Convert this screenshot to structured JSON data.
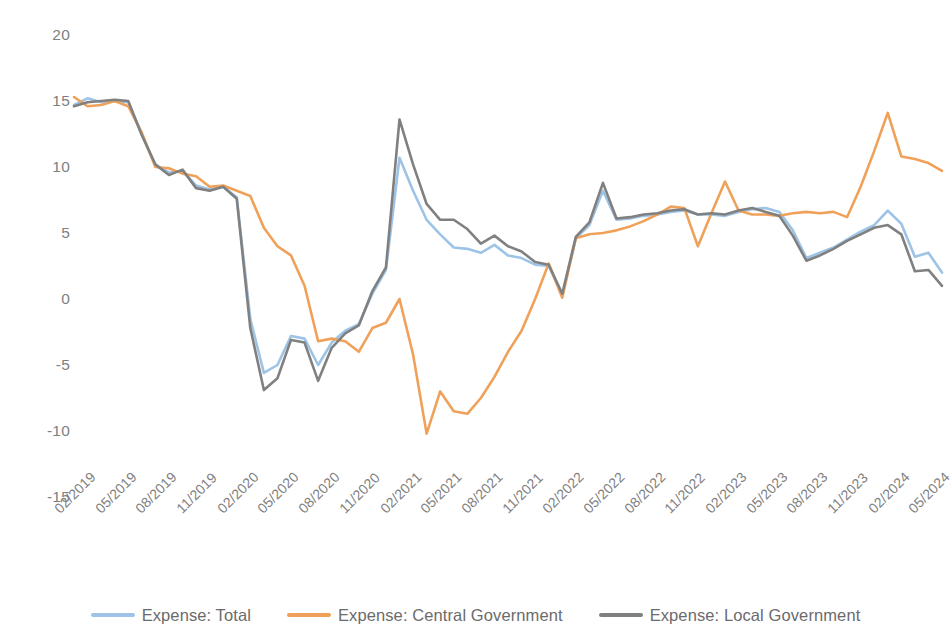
{
  "chart_data": {
    "type": "line",
    "title": "",
    "subtitle": "",
    "xlabel": "",
    "ylabel": "",
    "ylim": [
      -15,
      20
    ],
    "yticks": [
      20,
      15,
      10,
      5,
      0,
      -5,
      -10,
      -15
    ],
    "grid": false,
    "legend_position": "bottom",
    "x_tick_labels": [
      "02/2019",
      "05/2019",
      "08/2019",
      "11/2019",
      "02/2020",
      "05/2020",
      "08/2020",
      "11/2020",
      "02/2021",
      "05/2021",
      "08/2021",
      "11/2021",
      "02/2022",
      "05/2022",
      "08/2022",
      "11/2022",
      "02/2023",
      "05/2023",
      "08/2023",
      "11/2023",
      "02/2024",
      "05/2024"
    ],
    "x": [
      "02/2019",
      "03/2019",
      "04/2019",
      "05/2019",
      "06/2019",
      "07/2019",
      "08/2019",
      "09/2019",
      "10/2019",
      "11/2019",
      "12/2019",
      "01/2020",
      "02/2020",
      "03/2020",
      "04/2020",
      "05/2020",
      "06/2020",
      "07/2020",
      "08/2020",
      "09/2020",
      "10/2020",
      "11/2020",
      "12/2020",
      "01/2021",
      "02/2021",
      "03/2021",
      "04/2021",
      "05/2021",
      "06/2021",
      "07/2021",
      "08/2021",
      "09/2021",
      "10/2021",
      "11/2021",
      "12/2021",
      "01/2022",
      "02/2022",
      "03/2022",
      "04/2022",
      "05/2022",
      "06/2022",
      "07/2022",
      "08/2022",
      "09/2022",
      "10/2022",
      "11/2022",
      "12/2022",
      "01/2023",
      "02/2023",
      "03/2023",
      "04/2023",
      "05/2023",
      "06/2023",
      "07/2023",
      "08/2023",
      "09/2023",
      "10/2023",
      "11/2023",
      "12/2023",
      "01/2024",
      "02/2024",
      "03/2024",
      "04/2024",
      "05/2024",
      "06/2024"
    ],
    "series": [
      {
        "name": "Expense: Total",
        "color": "#9DC3E6",
        "values": [
          14.7,
          15.2,
          14.9,
          15.0,
          14.9,
          12.5,
          10.1,
          9.6,
          9.7,
          8.6,
          8.3,
          8.5,
          7.7,
          -1.5,
          -5.6,
          -5.0,
          -2.8,
          -3.0,
          -5.0,
          -3.3,
          -2.4,
          -1.9,
          0.4,
          2.2,
          10.7,
          8.2,
          6.0,
          4.9,
          3.9,
          3.8,
          3.5,
          4.1,
          3.3,
          3.1,
          2.6,
          2.5,
          0.3,
          4.6,
          5.6,
          8.2,
          6.0,
          6.1,
          6.3,
          6.4,
          6.6,
          6.7,
          6.4,
          6.4,
          6.3,
          6.6,
          6.8,
          6.9,
          6.6,
          5.2,
          3.1,
          3.5,
          3.9,
          4.5,
          5.1,
          5.6,
          6.7,
          5.7,
          3.2,
          3.5,
          2.0
        ]
      },
      {
        "name": "Expense: Central Government",
        "color": "#F0A159",
        "values": [
          15.3,
          14.6,
          14.7,
          15.0,
          14.6,
          12.6,
          10.0,
          9.9,
          9.5,
          9.3,
          8.5,
          8.6,
          8.2,
          7.8,
          5.4,
          4.0,
          3.3,
          1.0,
          -3.2,
          -3.0,
          -3.2,
          -4.0,
          -2.2,
          -1.8,
          0.0,
          -4.2,
          -10.2,
          -7.0,
          -8.5,
          -8.7,
          -7.5,
          -5.9,
          -4.0,
          -2.4,
          0.0,
          2.7,
          0.1,
          4.6,
          4.9,
          5.0,
          5.2,
          5.5,
          5.9,
          6.4,
          7.0,
          6.9,
          4.0,
          6.5,
          8.9,
          6.7,
          6.4,
          6.4,
          6.3,
          6.5,
          6.6,
          6.5,
          6.6,
          6.2,
          8.5,
          11.2,
          14.1,
          10.8,
          10.6,
          10.3,
          9.7
        ]
      },
      {
        "name": "Expense: Local Government",
        "color": "#808080",
        "values": [
          14.6,
          14.9,
          15.0,
          15.1,
          15.0,
          12.4,
          10.2,
          9.4,
          9.8,
          8.4,
          8.2,
          8.5,
          7.6,
          -2.2,
          -6.9,
          -6.0,
          -3.1,
          -3.3,
          -6.2,
          -3.7,
          -2.6,
          -2.0,
          0.6,
          2.4,
          13.6,
          10.2,
          7.2,
          6.0,
          6.0,
          5.3,
          4.2,
          4.8,
          4.0,
          3.6,
          2.8,
          2.6,
          0.4,
          4.7,
          5.8,
          8.8,
          6.1,
          6.2,
          6.4,
          6.5,
          6.7,
          6.8,
          6.4,
          6.5,
          6.4,
          6.7,
          6.9,
          6.6,
          6.3,
          4.8,
          2.9,
          3.3,
          3.8,
          4.4,
          4.9,
          5.4,
          5.6,
          4.9,
          2.1,
          2.2,
          1.0
        ]
      }
    ]
  },
  "legend": {
    "items": [
      {
        "label": "Expense: Total",
        "color": "#9DC3E6"
      },
      {
        "label": "Expense: Central Government",
        "color": "#F0A159"
      },
      {
        "label": "Expense: Local Government",
        "color": "#808080"
      }
    ]
  },
  "axis": {
    "y_labels": [
      "20",
      "15",
      "10",
      "5",
      "0",
      "-5",
      "-10",
      "-15"
    ]
  }
}
